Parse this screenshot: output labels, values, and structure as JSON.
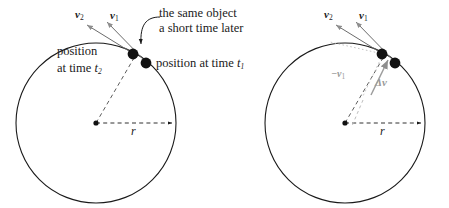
{
  "figure": {
    "background": "#ffffff",
    "stroke_color": "#1a1a1a",
    "gray_color": "#9a9a9a",
    "width": 449,
    "height": 208
  },
  "caption": {
    "line1": "the same object",
    "line2": "a short time later"
  },
  "left_panel": {
    "label_v2": "v",
    "label_v2_sub": "2",
    "label_v1": "v",
    "label_v1_sub": "1",
    "position_t2_line1": "position",
    "position_t2_line2": "at time ",
    "position_t2_var": "t",
    "position_t2_sub": "2",
    "position_t1": "position at time ",
    "position_t1_var": "t",
    "position_t1_sub": "1",
    "radius_label": "r",
    "circle": {
      "cx": 96,
      "cy": 123,
      "r": 80
    },
    "dot1": {
      "x": 145,
      "y": 62
    },
    "dot2": {
      "x": 133,
      "y": 54
    }
  },
  "right_panel": {
    "label_v2": "v",
    "label_v2_sub": "2",
    "label_v1": "v",
    "label_v1_sub": "1",
    "label_neg_v1": "−v",
    "label_neg_v1_sub": "1",
    "label_delta_v": "Δv",
    "radius_label": "r",
    "circle": {
      "cx": 345,
      "cy": 123,
      "r": 80
    },
    "dot1": {
      "x": 394,
      "y": 62
    },
    "dot2": {
      "x": 382,
      "y": 54
    }
  }
}
